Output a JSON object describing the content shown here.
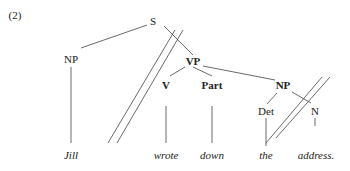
{
  "example_number": "(2)",
  "tree": {
    "nodes": {
      "s": "S",
      "np_subject": "NP",
      "vp": "VP",
      "v": "V",
      "part": "Part",
      "np_object": "NP",
      "det": "Det",
      "n": "N"
    },
    "words": {
      "jill": "Jill",
      "wrote": "wrote",
      "down": "down",
      "the": "the",
      "address": "address."
    }
  }
}
